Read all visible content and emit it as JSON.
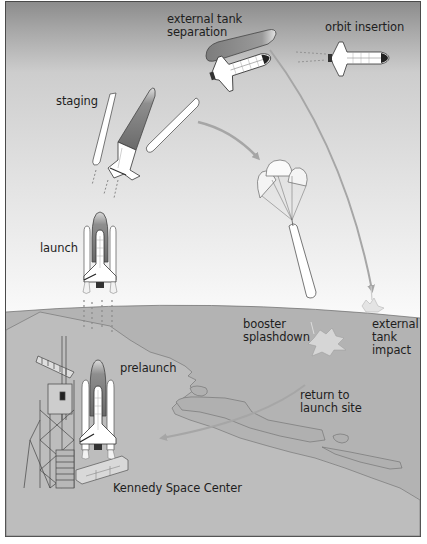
{
  "diagram": {
    "colors": {
      "sky_top": "#8a8a8a",
      "sky_mid": "#c9c9c9",
      "sky_bottom": "#f4f4f4",
      "sea": "#b4b4b4",
      "land": "#bdbdbd",
      "trajectory_arrow": "#a6a6a6",
      "frame_border": "#4a4a4a",
      "text": "#1e1e1e"
    },
    "labels": {
      "external_tank_separation": "external tank\nseparation",
      "orbit_insertion": "orbit insertion",
      "staging": "staging",
      "launch": "launch",
      "booster_splashdown": "booster\nsplashdown",
      "external_tank_impact": "external\ntank\nimpact",
      "prelaunch": "prelaunch",
      "return_to_launch_site": "return to\nlaunch site",
      "kennedy_space_center": "Kennedy Space Center"
    },
    "stages": [
      {
        "id": "prelaunch",
        "label": "prelaunch"
      },
      {
        "id": "launch",
        "label": "launch"
      },
      {
        "id": "staging",
        "label": "staging"
      },
      {
        "id": "booster_splashdown",
        "label": "booster splashdown"
      },
      {
        "id": "external_tank_separation",
        "label": "external tank separation"
      },
      {
        "id": "external_tank_impact",
        "label": "external tank impact"
      },
      {
        "id": "orbit_insertion",
        "label": "orbit insertion"
      },
      {
        "id": "return_to_launch_site",
        "label": "return to launch site"
      }
    ],
    "arrows": [
      {
        "from": "staging",
        "to": "booster_splashdown"
      },
      {
        "from": "external_tank_separation",
        "to": "external_tank_impact"
      },
      {
        "from": "return_to_launch_site",
        "to": "kennedy_space_center"
      }
    ]
  }
}
